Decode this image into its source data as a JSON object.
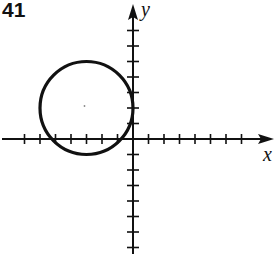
{
  "problem": {
    "number": "41"
  },
  "axes": {
    "x_label": "x",
    "y_label": "y",
    "origin_px": [
      133,
      139
    ],
    "tick_spacing_px": 15.5,
    "x_ticks_negative": 7,
    "x_ticks_positive": 7,
    "y_ticks_positive": 7,
    "y_ticks_negative": 7
  },
  "circle": {
    "center": [
      -3,
      2
    ],
    "radius": 3,
    "equation": "(x+3)^2 + (y-2)^2 = 9"
  },
  "colors": {
    "ink": "#111111",
    "background": "#ffffff"
  }
}
